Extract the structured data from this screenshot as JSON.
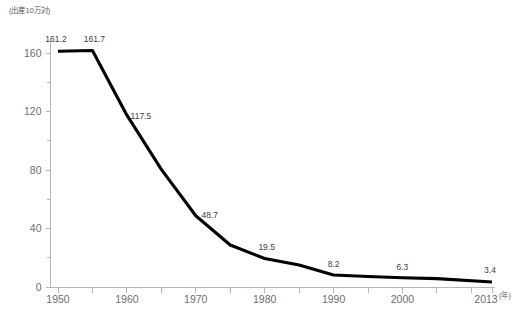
{
  "chart_data": {
    "type": "line",
    "title": "",
    "subtitle": "",
    "xlabel": "",
    "ylabel": "",
    "y_unit_label": "(出産10万対)",
    "x_unit_label": "(年)",
    "grid": false,
    "legend": "none",
    "line_color": "#000000",
    "axis_color": "#b6b6b6",
    "label_color": "#6d6d6d",
    "xlim": [
      1950,
      2013
    ],
    "ylim": [
      0,
      170
    ],
    "y_ticks": [
      0,
      40,
      80,
      120,
      160
    ],
    "y_tick_labels": [
      "0",
      "40",
      "80",
      "120",
      "160"
    ],
    "y_minor_ticks": [
      20,
      60,
      100,
      140
    ],
    "x_ticks": [
      1950,
      1955,
      1960,
      1965,
      1970,
      1975,
      1980,
      1985,
      1990,
      1995,
      2000,
      2005,
      2010,
      2013
    ],
    "x_tick_labels": [
      {
        "x": 1950,
        "label": "1950"
      },
      {
        "x": 1960,
        "label": "1960"
      },
      {
        "x": 1970,
        "label": "1970"
      },
      {
        "x": 1980,
        "label": "1980"
      },
      {
        "x": 1990,
        "label": "1990"
      },
      {
        "x": 2000,
        "label": "2000"
      },
      {
        "x": 2013,
        "label": "2013"
      }
    ],
    "x": [
      1950,
      1955,
      1960,
      1965,
      1970,
      1975,
      1980,
      1985,
      1990,
      1995,
      2000,
      2005,
      2013
    ],
    "values": [
      161.2,
      161.7,
      117.5,
      80.4,
      48.7,
      28.7,
      19.5,
      15.1,
      8.2,
      7.2,
      6.3,
      5.7,
      3.4
    ],
    "annotations": [
      {
        "x": 1950,
        "value": 161.2,
        "label": "161.2"
      },
      {
        "x": 1955,
        "value": 161.7,
        "label": "161.7"
      },
      {
        "x": 1960,
        "value": 117.5,
        "label": "117.5"
      },
      {
        "x": 1970,
        "value": 48.7,
        "label": "48.7"
      },
      {
        "x": 1980,
        "value": 19.5,
        "label": "19.5"
      },
      {
        "x": 1990,
        "value": 8.2,
        "label": "8.2"
      },
      {
        "x": 2000,
        "value": 6.3,
        "label": "6.3"
      },
      {
        "x": 2013,
        "value": 3.4,
        "label": "3.4"
      }
    ]
  }
}
